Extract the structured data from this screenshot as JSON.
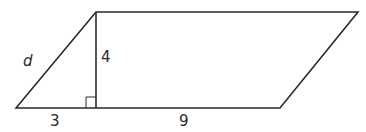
{
  "diagram": {
    "type": "parallelogram-with-altitude",
    "stroke_color": "#2a2a2a",
    "labels": {
      "slant_side": "d",
      "height": "4",
      "base_left_segment": "3",
      "base_right_segment": "9"
    },
    "right_angle_marker": true
  }
}
